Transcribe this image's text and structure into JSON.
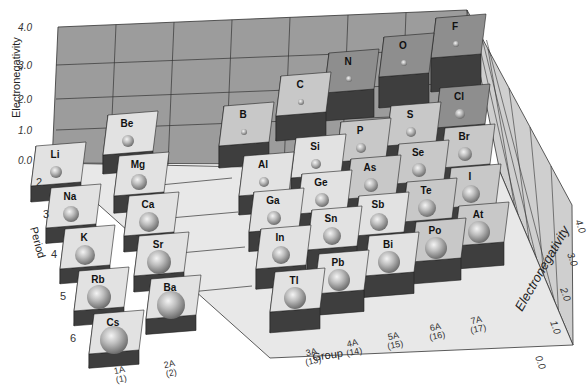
{
  "chart_data": {
    "type": "bar3d",
    "xlabel": "Group",
    "ylabel": "Period",
    "zlabel": "Electronegativity",
    "zlim": [
      0.0,
      4.0
    ],
    "z_ticks": [
      "0.0",
      "1.0",
      "2.0",
      "3.0",
      "4.0"
    ],
    "right_z_ticks": [
      "0.0",
      "1.0",
      "2.0",
      "3.0",
      "4.0"
    ],
    "periods": [
      "2",
      "3",
      "4",
      "5",
      "6"
    ],
    "groups": [
      {
        "label": "1A",
        "number": "(1)"
      },
      {
        "label": "2A",
        "number": "(2)"
      },
      {
        "label": "3A",
        "number": "(13)"
      },
      {
        "label": "4A",
        "number": "(14)"
      },
      {
        "label": "5A",
        "number": "(15)"
      },
      {
        "label": "6A",
        "number": "(16)"
      },
      {
        "label": "7A",
        "number": "(17)"
      }
    ],
    "elements": [
      {
        "symbol": "Li",
        "group": "1A",
        "period": 2,
        "value": 1.0
      },
      {
        "symbol": "Be",
        "group": "2A",
        "period": 2,
        "value": 1.5
      },
      {
        "symbol": "Na",
        "group": "1A",
        "period": 3,
        "value": 0.9
      },
      {
        "symbol": "Mg",
        "group": "2A",
        "period": 3,
        "value": 1.2
      },
      {
        "symbol": "K",
        "group": "1A",
        "period": 4,
        "value": 0.8
      },
      {
        "symbol": "Ca",
        "group": "2A",
        "period": 4,
        "value": 1.0
      },
      {
        "symbol": "Rb",
        "group": "1A",
        "period": 5,
        "value": 0.8
      },
      {
        "symbol": "Sr",
        "group": "2A",
        "period": 5,
        "value": 1.0
      },
      {
        "symbol": "Cs",
        "group": "1A",
        "period": 6,
        "value": 0.7
      },
      {
        "symbol": "Ba",
        "group": "2A",
        "period": 6,
        "value": 0.9
      },
      {
        "symbol": "B",
        "group": "3A",
        "period": 2,
        "value": 2.0
      },
      {
        "symbol": "C",
        "group": "4A",
        "period": 2,
        "value": 2.5
      },
      {
        "symbol": "N",
        "group": "5A",
        "period": 2,
        "value": 3.0
      },
      {
        "symbol": "O",
        "group": "6A",
        "period": 2,
        "value": 3.5
      },
      {
        "symbol": "F",
        "group": "7A",
        "period": 2,
        "value": 4.0
      },
      {
        "symbol": "Al",
        "group": "3A",
        "period": 3,
        "value": 1.5
      },
      {
        "symbol": "Si",
        "group": "4A",
        "period": 3,
        "value": 1.8
      },
      {
        "symbol": "P",
        "group": "5A",
        "period": 3,
        "value": 2.1
      },
      {
        "symbol": "S",
        "group": "6A",
        "period": 3,
        "value": 2.5
      },
      {
        "symbol": "Cl",
        "group": "7A",
        "period": 3,
        "value": 3.0
      },
      {
        "symbol": "Ga",
        "group": "3A",
        "period": 4,
        "value": 1.6
      },
      {
        "symbol": "Ge",
        "group": "4A",
        "period": 4,
        "value": 1.8
      },
      {
        "symbol": "As",
        "group": "5A",
        "period": 4,
        "value": 2.0
      },
      {
        "symbol": "Se",
        "group": "6A",
        "period": 4,
        "value": 2.4
      },
      {
        "symbol": "Br",
        "group": "7A",
        "period": 4,
        "value": 2.8
      },
      {
        "symbol": "In",
        "group": "3A",
        "period": 5,
        "value": 1.7
      },
      {
        "symbol": "Sn",
        "group": "4A",
        "period": 5,
        "value": 1.8
      },
      {
        "symbol": "Sb",
        "group": "5A",
        "period": 5,
        "value": 1.9
      },
      {
        "symbol": "Te",
        "group": "6A",
        "period": 5,
        "value": 2.1
      },
      {
        "symbol": "I",
        "group": "7A",
        "period": 5,
        "value": 2.5
      },
      {
        "symbol": "Tl",
        "group": "3A",
        "period": 6,
        "value": 1.8
      },
      {
        "symbol": "Pb",
        "group": "4A",
        "period": 6,
        "value": 1.9
      },
      {
        "symbol": "Bi",
        "group": "5A",
        "period": 6,
        "value": 1.9
      },
      {
        "symbol": "Po",
        "group": "6A",
        "period": 6,
        "value": 2.0
      },
      {
        "symbol": "At",
        "group": "7A",
        "period": 6,
        "value": 2.2
      }
    ],
    "grid": true,
    "legend": null
  },
  "labels": {
    "left_axis_title": "Electronegativity",
    "right_axis_title": "Electronegativity",
    "period_axis_title": "Period",
    "group_axis_title": "Group"
  },
  "colors": {
    "back_wall": "#9a9a9a",
    "grid_line": "#3a3a3a",
    "floor": "#e6e6e6",
    "low_top": "#e2e2e2",
    "mid_top": "#c8c8c8",
    "high_top": "#8e8e8e",
    "side_light": "#7a7a7a",
    "side_dark": "#3e3e3e",
    "sphere": "#a8a8a8"
  }
}
